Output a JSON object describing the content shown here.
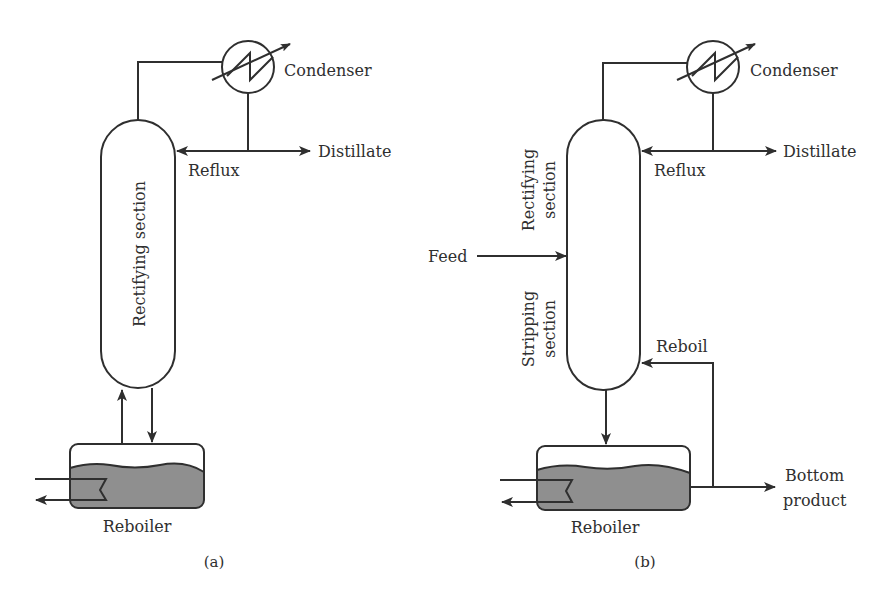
{
  "colors": {
    "line": "#2f2f2f",
    "liquid": "#8f8f8f",
    "background": "#ffffff"
  },
  "panel_a": {
    "caption": "(a)",
    "condenser_label": "Condenser",
    "distillate_label": "Distillate",
    "reflux_label": "Reflux",
    "column_label": "Rectifying section",
    "reboiler_label": "Reboiler"
  },
  "panel_b": {
    "caption": "(b)",
    "condenser_label": "Condenser",
    "distillate_label": "Distillate",
    "reflux_label": "Reflux",
    "feed_label": "Feed",
    "rectifying_label_line1": "Rectifying",
    "rectifying_label_line2": "section",
    "stripping_label_line1": "Stripping",
    "stripping_label_line2": "section",
    "reboil_label": "Reboil",
    "reboiler_label": "Reboiler",
    "bottom_product_line1": "Bottom",
    "bottom_product_line2": "product"
  }
}
